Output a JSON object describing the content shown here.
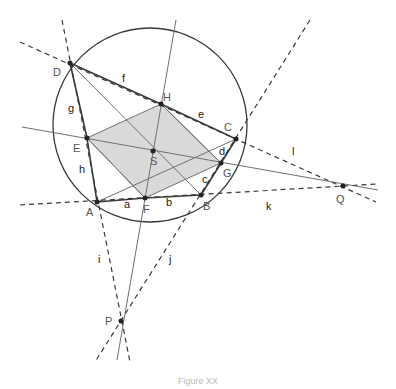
{
  "diagram": {
    "colors": {
      "solid_line": "#3a3a3a",
      "thin_line": "#707070",
      "dashed_line": "#3a3a3a",
      "fill": "#d9d9d9",
      "point": "#222222",
      "point_label": "#555555",
      "segment_label": "#222222"
    },
    "circle": {
      "cx": 150,
      "cy": 125,
      "r": 97
    },
    "points": {
      "A": {
        "label": "A",
        "x": 97,
        "y": 202,
        "lx": 86,
        "ly": 216
      },
      "B": {
        "label": "B",
        "x": 201,
        "y": 195,
        "lx": 203,
        "ly": 210
      },
      "C": {
        "label": "C",
        "x": 236,
        "y": 139,
        "lx": 224,
        "ly": 131
      },
      "D": {
        "label": "D",
        "x": 70,
        "y": 63,
        "lx": 53,
        "ly": 76
      },
      "E": {
        "label": "E",
        "x": 87,
        "y": 138,
        "lx": 73,
        "ly": 152
      },
      "F": {
        "label": "F",
        "x": 145,
        "y": 198,
        "lx": 143,
        "ly": 213
      },
      "G": {
        "label": "G",
        "x": 221,
        "y": 163,
        "lx": 223,
        "ly": 177
      },
      "H": {
        "label": "H",
        "x": 161,
        "y": 104,
        "lx": 163,
        "ly": 101
      },
      "S": {
        "label": "S",
        "x": 153,
        "y": 151,
        "lx": 150,
        "ly": 165
      },
      "P": {
        "label": "P",
        "x": 121,
        "y": 321,
        "lx": 105,
        "ly": 325
      },
      "Q": {
        "label": "Q",
        "x": 343,
        "y": 186,
        "lx": 336,
        "ly": 203
      }
    },
    "segment_labels": [
      {
        "label": "a",
        "x": 124,
        "y": 208
      },
      {
        "label": "b",
        "x": 166,
        "y": 206
      },
      {
        "label": "c",
        "x": 202,
        "y": 183
      },
      {
        "label": "d",
        "x": 219,
        "y": 155
      },
      {
        "label": "e",
        "x": 198,
        "y": 118
      },
      {
        "label": "f",
        "x": 122,
        "y": 82
      },
      {
        "label": "g",
        "x": 68,
        "y": 112
      },
      {
        "label": "h",
        "x": 79,
        "y": 173
      },
      {
        "label": "i",
        "x": 98,
        "y": 263
      },
      {
        "label": "j",
        "x": 169,
        "y": 263
      },
      {
        "label": "k",
        "x": 266,
        "y": 210
      },
      {
        "label": "l",
        "x": 292,
        "y": 155
      }
    ],
    "caption": "Figure XX"
  }
}
